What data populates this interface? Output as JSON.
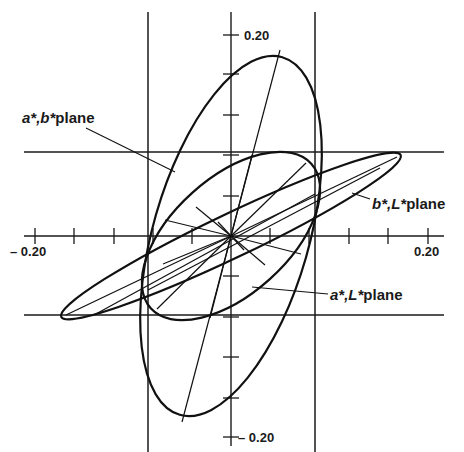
{
  "figure": {
    "type": "diagram",
    "colors": {
      "ink": "#111111",
      "background": "#ffffff"
    }
  },
  "axes": {
    "x_min_label": "– 0.20",
    "x_max_label": "0.20",
    "y_max_label": "0.20",
    "y_min_label": "– 0.20",
    "x_range": [
      -0.2,
      0.2
    ],
    "y_range": [
      -0.2,
      0.2
    ],
    "tick_step": 0.04
  },
  "labels": {
    "ab_plane": {
      "italic": "a*,b*",
      "rest": "plane"
    },
    "bL_plane": {
      "italic": "b*,L*",
      "rest": "plane"
    },
    "aL_plane": {
      "italic": "a*,L*",
      "rest": "plane"
    }
  },
  "ellipses": [
    {
      "name": "a*,b* plane",
      "cx": 0.0,
      "cy": 0.0,
      "semi_major": 0.19,
      "semi_minor": 0.082,
      "angle_deg": 74
    },
    {
      "name": "a*,L* plane",
      "cx": 0.0,
      "cy": 0.0,
      "semi_major": 0.105,
      "semi_minor": 0.06,
      "angle_deg": 40
    },
    {
      "name": "b*,L* plane",
      "cx": 0.0,
      "cy": 0.0,
      "semi_major": 0.195,
      "semi_minor": 0.022,
      "angle_deg": 25
    }
  ],
  "bounding_box": {
    "x": [
      -0.086,
      0.086
    ],
    "y": [
      -0.084,
      0.087
    ]
  }
}
